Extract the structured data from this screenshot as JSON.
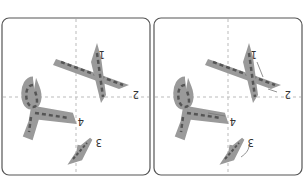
{
  "diagram": {
    "type": "stroke-order",
    "orientation": "rotated-180",
    "panels": [
      {
        "id": "left",
        "strokes": [
          "1",
          "2",
          "3",
          "4"
        ],
        "direction_arrows": false
      },
      {
        "id": "right",
        "strokes": [
          "1",
          "2",
          "3",
          "4"
        ],
        "direction_arrows": true
      }
    ],
    "colors": {
      "stroke_fill": "#9a9a9a",
      "dash": "#555555",
      "border": "#555555",
      "guide": "#bbbbbb"
    }
  }
}
